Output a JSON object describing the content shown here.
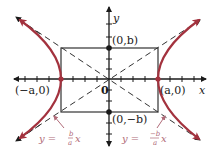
{
  "diagram": {
    "type": "hyperbola",
    "colors": {
      "curve": "#a3323e",
      "axes": "#1a1a1a",
      "rectangle": "#333333",
      "asymptote": "#333333",
      "label_asymptote": "#b06a78",
      "pointer": "#b06a78"
    },
    "axes": {
      "x_label": "x",
      "y_label": "y",
      "origin_label": "0"
    },
    "points": {
      "left_vertex": "(−a,0)",
      "right_vertex": "(a,0)",
      "top_covertex": "(0,b)",
      "bottom_covertex": "(0,−b)"
    },
    "asymptotes": {
      "left": {
        "lhs": "y =",
        "num": "b",
        "den": "a",
        "var": "x"
      },
      "right": {
        "lhs": "y =",
        "num": "−b",
        "den": "a",
        "var": "x"
      }
    }
  }
}
